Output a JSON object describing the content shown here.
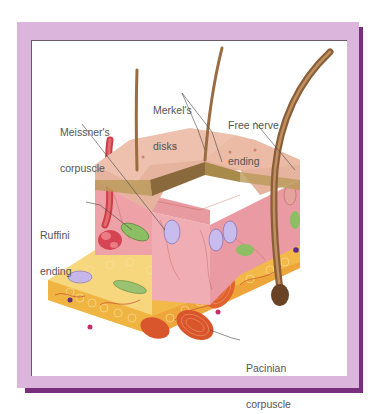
{
  "figure": {
    "frame_colors": {
      "outer": "#dcb5dc",
      "shadow": "#7a2f7e",
      "panel": "#ffffff"
    },
    "labels": [
      {
        "id": "meissners",
        "line1": "Meissner's",
        "line2": "corpuscle"
      },
      {
        "id": "merkels",
        "line1": "Merkel's",
        "line2": "disks"
      },
      {
        "id": "free-nerve",
        "line1": "Free nerve",
        "line2": "ending"
      },
      {
        "id": "ruffini",
        "line1": "Ruffini",
        "line2": "ending"
      },
      {
        "id": "pacinian",
        "line1": "Pacinian",
        "line2": "corpuscle"
      }
    ],
    "layers": {
      "epidermis": "#e8b9a3",
      "dermis": "#eea6ad",
      "hypodermis": "#f3c25a",
      "hair": "#a8774c"
    }
  }
}
